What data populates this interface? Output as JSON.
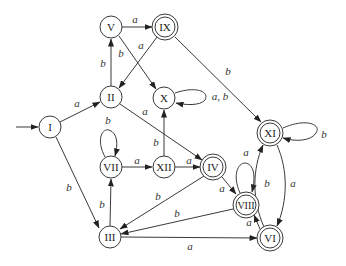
{
  "diagram": {
    "type": "finite-automaton",
    "start_state": "I",
    "states": [
      {
        "id": "I",
        "label": "I",
        "x": 50,
        "y": 127,
        "accepting": false
      },
      {
        "id": "II",
        "label": "II",
        "x": 111,
        "y": 97,
        "accepting": false
      },
      {
        "id": "V",
        "label": "V",
        "x": 111,
        "y": 27,
        "accepting": false
      },
      {
        "id": "IX",
        "label": "IX",
        "x": 165,
        "y": 27,
        "accepting": true
      },
      {
        "id": "X",
        "label": "X",
        "x": 164,
        "y": 98,
        "accepting": false
      },
      {
        "id": "VII",
        "label": "VII",
        "x": 111,
        "y": 167,
        "accepting": false
      },
      {
        "id": "XII",
        "label": "XII",
        "x": 164,
        "y": 167,
        "accepting": false
      },
      {
        "id": "III",
        "label": "III",
        "x": 110,
        "y": 237,
        "accepting": false
      },
      {
        "id": "IV",
        "label": "IV",
        "x": 213,
        "y": 167,
        "accepting": true
      },
      {
        "id": "VIII",
        "label": "VIII",
        "x": 246,
        "y": 205,
        "accepting": true
      },
      {
        "id": "VI",
        "label": "VI",
        "x": 270,
        "y": 238,
        "accepting": true
      },
      {
        "id": "XI",
        "label": "XI",
        "x": 270,
        "y": 133,
        "accepting": true
      }
    ],
    "transitions": [
      {
        "from": "I",
        "to": "II",
        "label": "a"
      },
      {
        "from": "I",
        "to": "III",
        "label": "b"
      },
      {
        "from": "II",
        "to": "V",
        "label": "b"
      },
      {
        "from": "II",
        "to": "IV",
        "label": "a"
      },
      {
        "from": "V",
        "to": "IX",
        "label": "a"
      },
      {
        "from": "V",
        "to": "X",
        "label": "b"
      },
      {
        "from": "IX",
        "to": "II",
        "label": "a"
      },
      {
        "from": "IX",
        "to": "XI",
        "label": "b"
      },
      {
        "from": "X",
        "to": "X",
        "label": "a, b"
      },
      {
        "from": "VII",
        "to": "VII",
        "label": "b"
      },
      {
        "from": "VII",
        "to": "XII",
        "label": "a"
      },
      {
        "from": "XII",
        "to": "X",
        "label": "b"
      },
      {
        "from": "XII",
        "to": "IV",
        "label": "a"
      },
      {
        "from": "III",
        "to": "VII",
        "label": "b"
      },
      {
        "from": "III",
        "to": "VI",
        "label": "a"
      },
      {
        "from": "IV",
        "to": "III",
        "label": "b"
      },
      {
        "from": "IV",
        "to": "VIII",
        "label": "a"
      },
      {
        "from": "VIII",
        "to": "VIII",
        "label": "a"
      },
      {
        "from": "VIII",
        "to": "III",
        "label": "b"
      },
      {
        "from": "VI",
        "to": "VIII",
        "label": "a"
      },
      {
        "from": "VI",
        "to": "XI",
        "label": "b"
      },
      {
        "from": "XI",
        "to": "VI",
        "label": "a"
      },
      {
        "from": "XI",
        "to": "XI",
        "label": "b"
      }
    ]
  },
  "labels": {
    "I": "I",
    "II": "II",
    "III": "III",
    "IV": "IV",
    "V": "V",
    "VI": "VI",
    "VII": "VII",
    "VIII": "VIII",
    "IX": "IX",
    "X": "X",
    "XI": "XI",
    "XII": "XII",
    "e_I_II": "a",
    "e_I_III": "b",
    "e_II_V": "b",
    "e_II_IV": "a",
    "e_V_IX": "a",
    "e_V_X": "b",
    "e_IX_II": "a",
    "e_IX_XI": "b",
    "e_X_X": "a, b",
    "e_VII_VII": "b",
    "e_VII_XII": "a",
    "e_XII_X": "b",
    "e_XII_IV": "a",
    "e_III_VII": "b",
    "e_III_VI": "a",
    "e_IV_III": "b",
    "e_IV_VIII": "a",
    "e_VIII_VIII": "a",
    "e_VIII_III": "b",
    "e_VI_VIII": "a",
    "e_VI_XI": "b",
    "e_XI_VI": "a",
    "e_XI_XI": "b"
  }
}
